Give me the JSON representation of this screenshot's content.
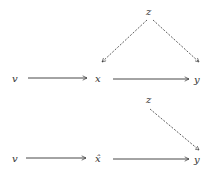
{
  "diagrams": [
    {
      "nodes": {
        "z": {
          "label": "z",
          "x": 150,
          "y": 14
        },
        "v": {
          "label": "v",
          "x": 16,
          "y": 81
        },
        "x": {
          "label": "x",
          "x": 99,
          "y": 81
        },
        "y": {
          "label": "y",
          "x": 198,
          "y": 82
        }
      },
      "edges": [
        {
          "from": "v",
          "to": "x",
          "style": "solid"
        },
        {
          "from": "x",
          "to": "y",
          "style": "solid"
        },
        {
          "from": "z",
          "to": "x",
          "style": "dashed"
        },
        {
          "from": "z",
          "to": "y",
          "style": "dashed"
        }
      ]
    },
    {
      "nodes": {
        "z": {
          "label": "z",
          "x": 150,
          "y": 102
        },
        "v": {
          "label": "v",
          "x": 16,
          "y": 161
        },
        "x": {
          "label": "x̂",
          "x": 99,
          "y": 161
        },
        "y": {
          "label": "y",
          "x": 198,
          "y": 162
        }
      },
      "edges": [
        {
          "from": "v",
          "to": "x",
          "style": "solid"
        },
        {
          "from": "x",
          "to": "y",
          "style": "solid"
        },
        {
          "from": "z",
          "to": "y",
          "style": "dashed"
        }
      ]
    }
  ],
  "colors": {
    "stroke": "#333333",
    "background": "#ffffff"
  }
}
